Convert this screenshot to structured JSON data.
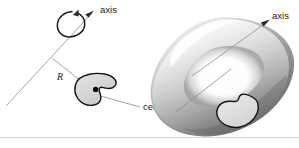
{
  "figure": {
    "canvas": {
      "width": 299,
      "height": 148,
      "background": "#ffffff"
    },
    "left_panel": {
      "name": "generating-region-and-axis",
      "axis_label": "axis",
      "radius_label": "R",
      "centroid_label": "centroid",
      "rotation_indicator": "rotation-arrow-ellipse",
      "description": "A slanted rotation axis with a curved rotation arrow, a plane region (shaded bean shape) at distance R from the axis, and its centroid marked by a dot."
    },
    "right_panel": {
      "name": "solid-of-revolution-torus",
      "axis_label": "axis",
      "description": "The torus (solid of revolution) generated by revolving the plane region about the axis, with the cross-section region outlined on its lower right."
    },
    "colors": {
      "stroke_dark": "#111111",
      "leader_gray": "#8a8a8a",
      "axis_gray": "#9a9a9a",
      "blob_fill": "#d9d9d9",
      "torus_light": "#f2f2f2",
      "torus_mid": "#b5b5b5",
      "torus_dark": "#6e6e6e",
      "text": "#1a1a1a",
      "background": "#ffffff"
    }
  }
}
